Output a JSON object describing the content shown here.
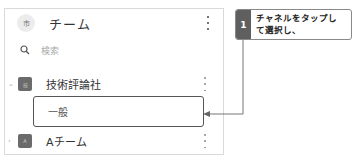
{
  "panel": {
    "header": {
      "avatar_text": "市",
      "title": "チーム",
      "menu_icon": "kebab-menu-icon"
    },
    "search": {
      "icon": "search-icon",
      "placeholder": "検索"
    },
    "teams": [
      {
        "expanded": true,
        "chevron": "chevron-down-icon",
        "avatar_text": "技",
        "name": "技術評論社",
        "channels": [
          {
            "name": "一般",
            "highlighted": true
          }
        ]
      },
      {
        "expanded": false,
        "chevron": "chevron-right-icon",
        "avatar_text": "A",
        "name": "Aチーム"
      }
    ]
  },
  "annotation": {
    "step_number": "1",
    "text_line1": "チャネルをタップし",
    "text_line2": "て選択し、",
    "colors": {
      "badge": "#5f5f5f",
      "border": "#888888",
      "connector": "#777777"
    }
  }
}
